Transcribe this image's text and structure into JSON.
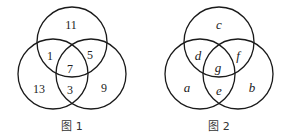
{
  "figures": [
    {
      "caption": "图 1",
      "circles": [
        {
          "name": "top",
          "cx": 72,
          "cy": 42,
          "r": 35
        },
        {
          "name": "left",
          "cx": 53,
          "cy": 73,
          "r": 35
        },
        {
          "name": "right",
          "cx": 91,
          "cy": 73,
          "r": 35
        }
      ],
      "regions": {
        "top_only": "11",
        "left_top": "1",
        "right_top": "5",
        "all_three": "7",
        "left_only": "13",
        "left_right": "3",
        "right_only": "9"
      }
    },
    {
      "caption": "图 2",
      "circles": [
        {
          "name": "top",
          "cx": 220,
          "cy": 42,
          "r": 35
        },
        {
          "name": "left",
          "cx": 201,
          "cy": 73,
          "r": 35
        },
        {
          "name": "right",
          "cx": 239,
          "cy": 73,
          "r": 35
        }
      ],
      "regions": {
        "top_only": "c",
        "left_top": "d",
        "right_top": "f",
        "all_three": "g",
        "left_only": "a",
        "left_right": "e",
        "right_only": "b"
      }
    }
  ]
}
